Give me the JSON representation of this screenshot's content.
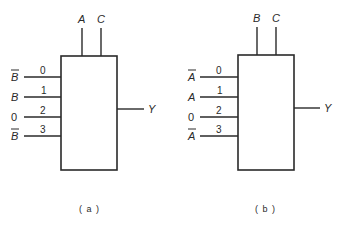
{
  "figure": {
    "diagrams": [
      {
        "id": "a",
        "caption": "( a )",
        "select_inputs": [
          "A",
          "C"
        ],
        "output": "Y",
        "data_inputs": [
          {
            "index": "0",
            "signal": "B",
            "complemented": true
          },
          {
            "index": "1",
            "signal": "B",
            "complemented": false
          },
          {
            "index": "2",
            "signal": "0",
            "complemented": false
          },
          {
            "index": "3",
            "signal": "B",
            "complemented": true
          }
        ]
      },
      {
        "id": "b",
        "caption": "( b )",
        "select_inputs": [
          "B",
          "C"
        ],
        "output": "Y",
        "data_inputs": [
          {
            "index": "0",
            "signal": "A",
            "complemented": true
          },
          {
            "index": "1",
            "signal": "A",
            "complemented": false
          },
          {
            "index": "2",
            "signal": "0",
            "complemented": false
          },
          {
            "index": "3",
            "signal": "A",
            "complemented": true
          }
        ]
      }
    ]
  }
}
